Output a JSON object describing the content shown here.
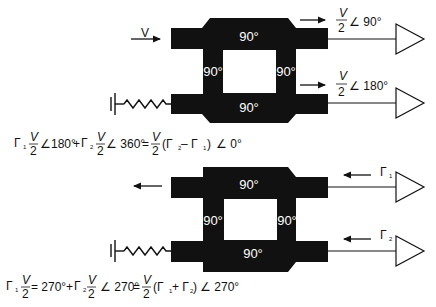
{
  "diagram": {
    "title": "",
    "colors": {
      "coupler": "#111111",
      "background": "#ffffff",
      "line": "#111111",
      "label_on_coupler": "#ffffff"
    },
    "top_coupler": {
      "sections": {
        "top": "90°",
        "bottom": "90°",
        "left": "90°",
        "right": "90°"
      },
      "input_label": "V",
      "output_top": {
        "numerator": "V",
        "denominator": "2",
        "angle": "∠ 90°"
      },
      "output_bottom": {
        "numerator": "V",
        "denominator": "2",
        "angle": "∠ 180°"
      },
      "termination": "resistor-to-ground"
    },
    "top_equation": {
      "t1": "Γ",
      "t1sub": "1",
      "t1num": "V",
      "t1den": "2",
      "t1ang": "∠180°",
      "plus": "+",
      "t2": "Γ",
      "t2sub": "2",
      "t2num": "V",
      "t2den": "2",
      "t2ang": "∠ 360°",
      "eq": "=",
      "rnum": "V",
      "rden": "2",
      "rparen": "(Γ",
      "rsub2": "2",
      "rminus": " – Γ",
      "rsub1": "1",
      "rclose": ")",
      "rang": "∠ 0°"
    },
    "bottom_coupler": {
      "sections": {
        "top": "90°",
        "bottom": "90°",
        "left": "90°",
        "right": "90°"
      },
      "reflection_top": {
        "symbol": "Γ",
        "sub": "1"
      },
      "reflection_bottom": {
        "symbol": "Γ",
        "sub": "2"
      },
      "termination": "resistor-to-ground"
    },
    "bottom_equation": {
      "t1": "Γ",
      "t1sub": "1",
      "t1num": "V",
      "t1den": "2",
      "t1ang": "= 270°",
      "plus": "+",
      "t2": "Γ",
      "t2sub": "2",
      "t2num": "V",
      "t2den": "2",
      "t2ang": "∠ 270°",
      "eq": "=",
      "rnum": "V",
      "rden": "2",
      "rparen": "(Γ",
      "rsub1": "1",
      "rplus": "+ Γ",
      "rsub2": "2",
      "rclose": ")",
      "rang": "∠ 270°"
    }
  }
}
